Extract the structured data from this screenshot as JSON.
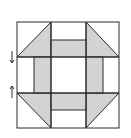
{
  "diagram": {
    "title": "",
    "type": "quilt-block",
    "pattern": "churn-dash",
    "colors": {
      "background": "#ffffff",
      "fill": "#d3d3d3",
      "stroke": "#2a2a2a"
    },
    "grid": {
      "rows": 3,
      "cols": 3
    },
    "markers": [
      {
        "name": "arrow-down",
        "glyph": "↓"
      },
      {
        "name": "arrow-up",
        "glyph": "↑"
      }
    ]
  }
}
